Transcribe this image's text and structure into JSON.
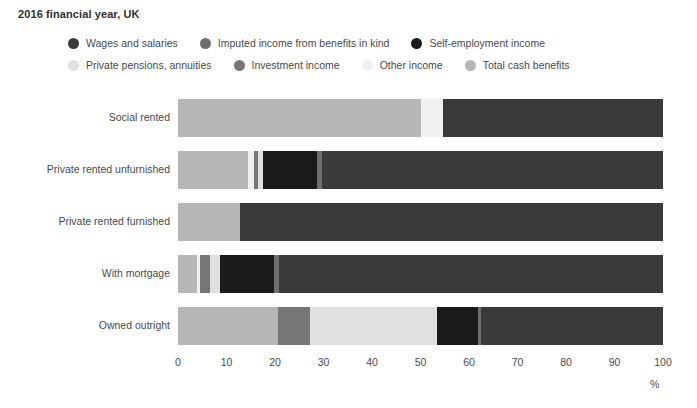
{
  "title": "2016 financial year, UK",
  "axis_unit": "%",
  "legend": {
    "row1": [
      {
        "label": "Wages and salaries",
        "color": "#3a3a3a"
      },
      {
        "label": "Imputed income from benefits in kind",
        "color": "#6e6e6e"
      },
      {
        "label": "Self-employment income",
        "color": "#1a1a1a"
      }
    ],
    "row2": [
      {
        "label": "Private pensions, annuities",
        "color": "#e0e0e0"
      },
      {
        "label": "Investment income",
        "color": "#767676"
      },
      {
        "label": "Other income",
        "color": "#f0f0f0"
      },
      {
        "label": "Total cash benefits",
        "color": "#b6b6b6"
      }
    ]
  },
  "chart_data": {
    "type": "bar",
    "orientation": "horizontal",
    "stacked": true,
    "title": "2016 financial year, UK",
    "xlabel": "%",
    "ylabel": "",
    "xlim": [
      0,
      100
    ],
    "grid": false,
    "legend_position": "top",
    "tick_labels": [
      "0",
      "10",
      "20",
      "30",
      "40",
      "50",
      "60",
      "70",
      "80",
      "90",
      "100"
    ],
    "ticks": [
      0,
      10,
      20,
      30,
      40,
      50,
      60,
      70,
      80,
      90,
      100
    ],
    "categories": [
      "Social rented",
      "Private rented unfurnished",
      "Private rented furnished",
      "With mortgage",
      "Owned outright"
    ],
    "series": [
      {
        "name": "Total cash benefits",
        "color": "#b6b6b6",
        "values": [
          50.0,
          14.4,
          12.8,
          4.0,
          20.6
        ]
      },
      {
        "name": "Other income",
        "color": "#f0f0f0",
        "values": [
          4.6,
          1.2,
          0.0,
          0.6,
          0.0
        ]
      },
      {
        "name": "Investment income",
        "color": "#767676",
        "values": [
          0.0,
          0.9,
          0.0,
          1.9,
          6.6
        ]
      },
      {
        "name": "Private pensions, annuities",
        "color": "#e0e0e0",
        "values": [
          0.0,
          1.0,
          0.0,
          2.1,
          26.2
        ]
      },
      {
        "name": "Self-employment income",
        "color": "#1a1a1a",
        "values": [
          0.0,
          11.1,
          0.0,
          11.1,
          8.5
        ]
      },
      {
        "name": "Imputed income from benefits in kind",
        "color": "#6e6e6e",
        "values": [
          0.0,
          1.0,
          0.0,
          1.2,
          0.6
        ]
      },
      {
        "name": "Wages and salaries",
        "color": "#3a3a3a",
        "values": [
          45.4,
          70.4,
          87.2,
          79.1,
          37.5
        ]
      }
    ],
    "stack_order": [
      "Total cash benefits",
      "Other income",
      "Investment income",
      "Private pensions, annuities",
      "Self-employment income",
      "Imputed income from benefits in kind",
      "Wages and salaries"
    ],
    "bars": [
      {
        "category": "Social rented",
        "segments": [
          {
            "series": "Total cash benefits",
            "value": 50.0,
            "color": "#b6b6b6"
          },
          {
            "series": "Other income",
            "value": 4.6,
            "color": "#f0f0f0"
          },
          {
            "series": "Wages and salaries",
            "value": 45.4,
            "color": "#3a3a3a"
          }
        ]
      },
      {
        "category": "Private rented unfurnished",
        "segments": [
          {
            "series": "Total cash benefits",
            "value": 14.4,
            "color": "#b6b6b6"
          },
          {
            "series": "Other income",
            "value": 1.2,
            "color": "#f0f0f0"
          },
          {
            "series": "Investment income",
            "value": 0.9,
            "color": "#767676"
          },
          {
            "series": "Private pensions, annuities",
            "value": 1.0,
            "color": "#e0e0e0"
          },
          {
            "series": "Self-employment income",
            "value": 11.1,
            "color": "#1a1a1a"
          },
          {
            "series": "Imputed income from benefits in kind",
            "value": 1.0,
            "color": "#6e6e6e"
          },
          {
            "series": "Wages and salaries",
            "value": 70.4,
            "color": "#3a3a3a"
          }
        ]
      },
      {
        "category": "Private rented furnished",
        "segments": [
          {
            "series": "Total cash benefits",
            "value": 12.8,
            "color": "#b6b6b6"
          },
          {
            "series": "Wages and salaries",
            "value": 87.2,
            "color": "#3a3a3a"
          }
        ]
      },
      {
        "category": "With mortgage",
        "segments": [
          {
            "series": "Total cash benefits",
            "value": 4.0,
            "color": "#b6b6b6"
          },
          {
            "series": "Other income",
            "value": 0.6,
            "color": "#f0f0f0"
          },
          {
            "series": "Investment income",
            "value": 1.9,
            "color": "#767676"
          },
          {
            "series": "Private pensions, annuities",
            "value": 2.1,
            "color": "#e0e0e0"
          },
          {
            "series": "Self-employment income",
            "value": 11.1,
            "color": "#1a1a1a"
          },
          {
            "series": "Imputed income from benefits in kind",
            "value": 1.2,
            "color": "#6e6e6e"
          },
          {
            "series": "Wages and salaries",
            "value": 79.1,
            "color": "#3a3a3a"
          }
        ]
      },
      {
        "category": "Owned outright",
        "segments": [
          {
            "series": "Total cash benefits",
            "value": 20.6,
            "color": "#b6b6b6"
          },
          {
            "series": "Investment income",
            "value": 6.6,
            "color": "#767676"
          },
          {
            "series": "Private pensions, annuities",
            "value": 26.2,
            "color": "#e0e0e0"
          },
          {
            "series": "Self-employment income",
            "value": 8.5,
            "color": "#1a1a1a"
          },
          {
            "series": "Imputed income from benefits in kind",
            "value": 0.6,
            "color": "#6e6e6e"
          },
          {
            "series": "Wages and salaries",
            "value": 37.5,
            "color": "#3a3a3a"
          }
        ]
      }
    ]
  }
}
